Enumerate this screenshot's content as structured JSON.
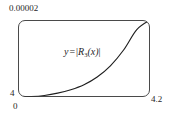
{
  "figure": {
    "kind": "calculus-remainder-plot",
    "background_color": "#ffffff",
    "frame_color": "#4a4a4a",
    "curve_color": "#1f1f1f"
  },
  "annotation": {
    "y_symbol": "y",
    "equals": "=",
    "bar_open": "|",
    "function_name": "R",
    "subscript": "3",
    "argument": "(x)",
    "bar_close": "|",
    "full_text": "y = |R3(x)|"
  },
  "labels": {
    "y_max": "0.00002",
    "y_min": "4",
    "x_min": "0",
    "x_max": "4.2"
  },
  "chart_data": {
    "type": "line",
    "title": "",
    "subtitle": "",
    "xlabel": "",
    "ylabel": "",
    "legend_position": "inline-annotation",
    "grid": false,
    "xlim": [
      0,
      4.2
    ],
    "ylim": [
      0,
      2e-05
    ],
    "x_tick_labels": [
      "0",
      "4.2"
    ],
    "y_tick_labels": [
      "4",
      "0.00002"
    ],
    "annotations": [
      {
        "text": "y = |R3(x)|",
        "x": 2.1,
        "y": 1.28e-05
      }
    ],
    "series": [
      {
        "name": "y = |R3(x)|",
        "x": [
          0,
          0.42,
          0.84,
          1.26,
          1.68,
          2.1,
          2.52,
          2.94,
          3.36,
          3.78,
          4.2
        ],
        "values": [
          0.0,
          1e-07,
          4e-07,
          1e-06,
          1.9e-06,
          3.2e-06,
          5.2e-06,
          8.1e-06,
          1.22e-05,
          1.75e-05,
          2e-05
        ]
      }
    ]
  },
  "curve_path": "M 18 96.4 C 38 96.2 58 94.6 78 89.4 C 98 83.2 118 69.0 136 44.5 L 149.5 24.5"
}
